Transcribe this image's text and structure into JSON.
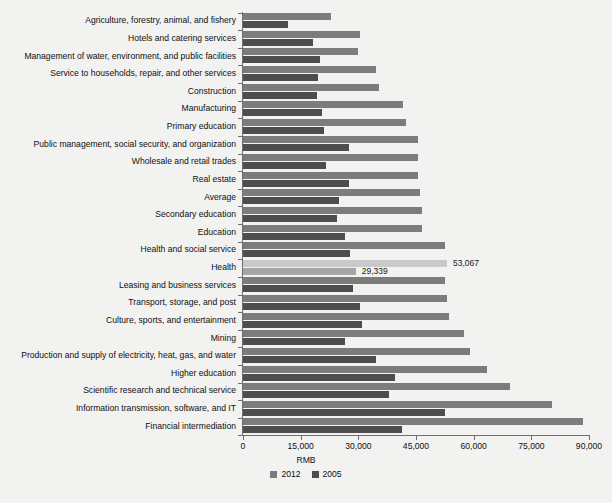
{
  "chart_data": {
    "type": "bar",
    "orientation": "horizontal",
    "title": "",
    "xlabel": "RMB",
    "ylabel": "",
    "xlim": [
      0,
      90000
    ],
    "xticks": [
      "0",
      "15,000",
      "30,000",
      "45,000",
      "60,000",
      "75,000",
      "90,000"
    ],
    "xtick_values": [
      0,
      15000,
      30000,
      45000,
      60000,
      75000,
      90000
    ],
    "grid": false,
    "legend_position": "bottom-center",
    "legend": [
      "2012",
      "2005"
    ],
    "series": [
      {
        "name": "2012",
        "color": "#7c7c7c",
        "values": [
          23000,
          30400,
          30000,
          34500,
          35500,
          41500,
          42500,
          45500,
          45500,
          45500,
          46000,
          46500,
          46500,
          52500,
          53067,
          52500,
          53000,
          53500,
          57500,
          59000,
          63500,
          69500,
          80500,
          88500
        ]
      },
      {
        "name": "2005",
        "color": "#4d4d4d",
        "values": [
          11800,
          18300,
          20000,
          19500,
          19300,
          20500,
          21000,
          27500,
          21500,
          27500,
          25000,
          24500,
          26500,
          27800,
          29339,
          28500,
          30500,
          31000,
          26500,
          34500,
          39500,
          38000,
          52500,
          41300
        ]
      }
    ],
    "categories": [
      "Agriculture, forestry, animal, and fishery",
      "Hotels and catering services",
      "Management of water, environment, and public facilities",
      "Service to households, repair, and other services",
      "Construction",
      "Manufacturing",
      "Primary education",
      "Public management, social security, and organization",
      "Wholesale and retail trades",
      "Real estate",
      "Average",
      "Secondary education",
      "Education",
      "Health and social service",
      "Health",
      "Leasing and business services",
      "Transport, storage, and post",
      "Culture, sports, and entertainment",
      "Mining",
      "Production and supply of electricity, heat, gas, and water",
      "Higher education",
      "Scientific research and technical service",
      "Information transmission, software, and IT",
      "Financial intermediation"
    ],
    "highlight_category": "Health",
    "highlight_colors": {
      "2012": "#c9c9c9",
      "2005": "#a6a6a6"
    },
    "annotations": [
      {
        "category": "Health",
        "series": "2012",
        "value": 53067,
        "text": "53,067"
      },
      {
        "category": "Health",
        "series": "2005",
        "value": 29339,
        "text": "29,339"
      }
    ]
  }
}
